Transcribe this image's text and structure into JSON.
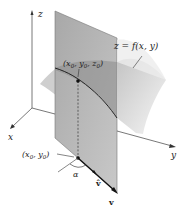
{
  "diagram": {
    "type": "3d-directional-derivative",
    "axes": {
      "z_label": "z",
      "x_label": "x",
      "y_label": "y"
    },
    "surface_label": "z = f(x, y)",
    "point_3d_label": "(x0, y0, z0)",
    "point_3d": {
      "base": "(x",
      "s1": "0",
      "mid1": ", y",
      "s2": "0",
      "mid2": ", z",
      "s3": "0",
      "end": ")"
    },
    "point_2d_label": "(x0, y0)",
    "point_2d": {
      "base": "(x",
      "s1": "0",
      "mid1": ", y",
      "s2": "0",
      "end": ")"
    },
    "angle_label": "α",
    "unit_vector_label": "v̂",
    "vector_label": "v",
    "colors": {
      "plane_fill": "#9a9a9a",
      "surface_fill": "#d9d9d9",
      "curve": "#222222",
      "axis": "#555555"
    }
  }
}
